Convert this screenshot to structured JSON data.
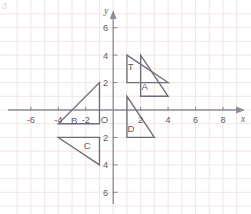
{
  "figure": {
    "corner_number": "3",
    "background_color": "#ffffff",
    "grid_color": "#f0dede",
    "axis_color": "#8c8c96",
    "shape_color": "#6e6e7a",
    "label_color": "#5d5d68"
  },
  "chart_data": {
    "type": "scatter",
    "title": "",
    "xlabel": "x",
    "ylabel": "y",
    "xlim": [
      -7.5,
      9.2
    ],
    "ylim": [
      -7.2,
      7.2
    ],
    "grid": true,
    "grid_step": 1,
    "legend": "none",
    "origin_label": "O",
    "x_ticks": [
      -6,
      -4,
      -2,
      2,
      4,
      6,
      8
    ],
    "x_tick_labels": [
      "-6",
      "-4",
      "-2",
      "2",
      "4",
      "6",
      "8"
    ],
    "y_ticks": [
      6,
      4,
      2,
      -2,
      -4,
      -6
    ],
    "y_tick_labels": [
      "6",
      "4",
      "2",
      "2",
      "4",
      "6"
    ],
    "shapes": [
      {
        "name": "T",
        "label": "T",
        "label_point": [
          1.28,
          2.95
        ],
        "vertices": [
          [
            1,
            4
          ],
          [
            1,
            2
          ],
          [
            4,
            2
          ]
        ]
      },
      {
        "name": "A",
        "label": "A",
        "label_point": [
          2.3,
          1.45
        ],
        "vertices": [
          [
            2,
            4
          ],
          [
            2,
            1
          ],
          [
            4,
            1
          ]
        ]
      },
      {
        "name": "B",
        "label": "B",
        "label_point": [
          -2.85,
          -1.05
        ],
        "vertices": [
          [
            -4,
            -1
          ],
          [
            -1,
            -1
          ],
          [
            -1,
            2
          ]
        ]
      },
      {
        "name": "C",
        "label": "C",
        "label_point": [
          -1.9,
          -2.85
        ],
        "vertices": [
          [
            -4,
            -2
          ],
          [
            -1,
            -2
          ],
          [
            -1,
            -4
          ]
        ]
      },
      {
        "name": "D",
        "label": "D",
        "label_point": [
          1.3,
          -1.6
        ],
        "vertices": [
          [
            1,
            1
          ],
          [
            1,
            -2
          ],
          [
            3,
            -2
          ]
        ]
      }
    ]
  }
}
